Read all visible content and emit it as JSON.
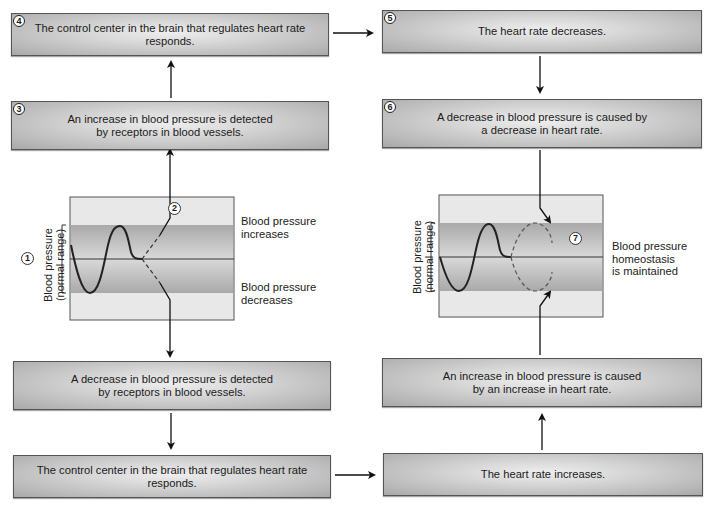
{
  "diagram": {
    "colors": {
      "box_fill": "#c8c8c8",
      "normal_band": "#b4b4b4",
      "graph_bg": "#e6e6e6",
      "line": "#222222"
    }
  },
  "top_row": {
    "box4": {
      "step": "4",
      "text": "The control center in the brain that regulates heart rate responds."
    },
    "box5": {
      "step": "5",
      "text": "The heart rate decreases."
    }
  },
  "second_row": {
    "box3": {
      "step": "3",
      "text": "An increase in blood pressure is detected\nby receptors in blood vessels."
    },
    "box6": {
      "step": "6",
      "text": "A decrease in blood pressure is caused by\na decrease in heart rate."
    }
  },
  "left_graph": {
    "step1": "1",
    "step2": "2",
    "axis_label": "Blood pressure\n(normal range)",
    "label_increase": "Blood pressure\nincreases",
    "label_decrease": "Blood pressure\ndecreases"
  },
  "right_graph": {
    "step7": "7",
    "axis_label": "Blood pressure\n(normal range)",
    "label_maintained": "Blood pressure\nhomeostasis\nis maintained"
  },
  "fourth_row": {
    "left": {
      "text": "A decrease in blood pressure is detected\nby receptors in blood vessels."
    },
    "right": {
      "text": "An increase in blood pressure is caused\nby an increase in heart rate."
    }
  },
  "bottom_row": {
    "left": {
      "text": "The control center in the brain that regulates heart rate responds."
    },
    "right": {
      "text": "The heart rate increases."
    }
  }
}
